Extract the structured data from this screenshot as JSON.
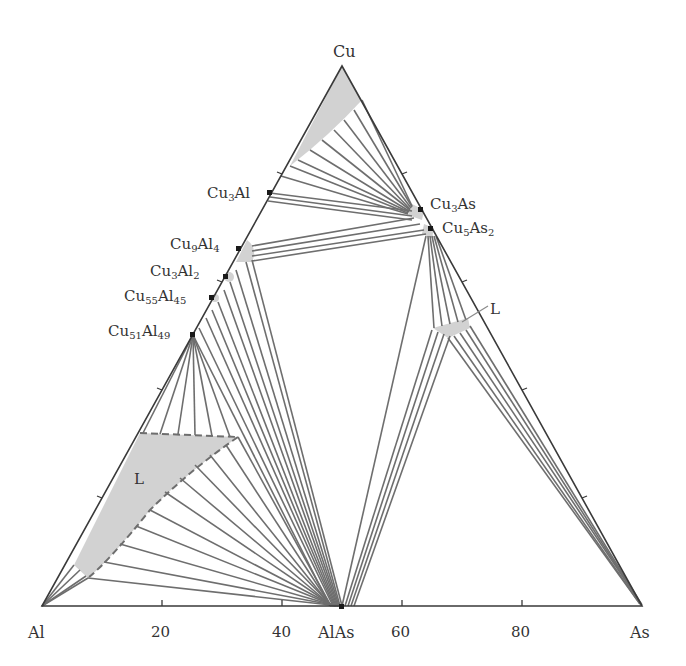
{
  "diagram": {
    "type": "ternary-phase-diagram",
    "system": "Al-As-Cu",
    "vertices": {
      "top": {
        "label": "Cu"
      },
      "left": {
        "label": "Al"
      },
      "right": {
        "label": "As"
      }
    },
    "bottom_axis": {
      "tick_labels": [
        "20",
        "40",
        "60",
        "80"
      ],
      "compound_label": "AlAs"
    },
    "phases": [
      {
        "id": "Cu3Al",
        "main": "Cu",
        "sub1": "3",
        "el2": "Al",
        "sub2": ""
      },
      {
        "id": "Cu9Al4",
        "main": "Cu",
        "sub1": "9",
        "el2": "Al",
        "sub2": "4"
      },
      {
        "id": "Cu3Al2",
        "main": "Cu",
        "sub1": "3",
        "el2": "Al",
        "sub2": "2"
      },
      {
        "id": "Cu55Al45",
        "main": "Cu",
        "sub1": "55",
        "el2": "Al",
        "sub2": "45"
      },
      {
        "id": "Cu51Al49",
        "main": "Cu",
        "sub1": "51",
        "el2": "Al",
        "sub2": "49"
      },
      {
        "id": "Cu3As",
        "main": "Cu",
        "sub1": "3",
        "el2": "As",
        "sub2": ""
      },
      {
        "id": "Cu5As2",
        "main": "Cu",
        "sub1": "5",
        "el2": "As",
        "sub2": "2"
      }
    ],
    "liquid_labels": [
      "L",
      "L"
    ],
    "colors": {
      "lines": "#6e6e6e",
      "frame": "#3a3a3a",
      "phase_fill": "#d2d2d2",
      "marker": "#1a1a1a"
    }
  }
}
